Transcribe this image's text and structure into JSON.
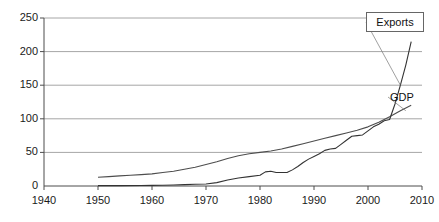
{
  "chart_data": {
    "type": "line",
    "title": "",
    "subtitle": "",
    "xlabel": "",
    "ylabel": "",
    "xlim": [
      1940,
      2010
    ],
    "ylim": [
      0,
      250
    ],
    "grid": true,
    "grid_axis": "y",
    "legend_position": "inline-right",
    "xticks": [
      1940,
      1950,
      1960,
      1970,
      1980,
      1990,
      2000,
      2010
    ],
    "yticks": [
      0,
      50,
      100,
      150,
      200,
      250
    ],
    "xtick_labels": [
      "1940",
      "1950",
      "1960",
      "1970",
      "1980",
      "1990",
      "2000",
      "2010"
    ],
    "ytick_labels": [
      "0",
      "50",
      "100",
      "150",
      "200",
      "250"
    ],
    "series": [
      {
        "name": "GDP",
        "color": "#4d4d4d",
        "label_text": "GDP",
        "x": [
          1950,
          1952,
          1954,
          1956,
          1958,
          1960,
          1962,
          1964,
          1966,
          1968,
          1970,
          1972,
          1974,
          1976,
          1978,
          1980,
          1982,
          1984,
          1986,
          1988,
          1990,
          1992,
          1994,
          1996,
          1998,
          2000,
          2002,
          2004,
          2006,
          2008
        ],
        "values": [
          13,
          14,
          15,
          16,
          17,
          18,
          20,
          22,
          25,
          28,
          32,
          36,
          41,
          45,
          48,
          50,
          52,
          55,
          59,
          63,
          67,
          71,
          75,
          79,
          83,
          88,
          95,
          103,
          112,
          120
        ]
      },
      {
        "name": "Exports",
        "color": "#333333",
        "label_text": "Exports",
        "boxed_label": true,
        "x": [
          1950,
          1954,
          1958,
          1960,
          1962,
          1964,
          1966,
          1968,
          1970,
          1972,
          1974,
          1976,
          1978,
          1980,
          1981,
          1982,
          1983,
          1984,
          1985,
          1986,
          1987,
          1988,
          1989,
          1990,
          1991,
          1992,
          1993,
          1994,
          1995,
          1996,
          1997,
          1998,
          1999,
          2000,
          2001,
          2002,
          2003,
          2004,
          2005,
          2006,
          2007,
          2008
        ],
        "values": [
          0.5,
          0.6,
          0.8,
          1,
          1.2,
          1.5,
          2,
          2.5,
          3,
          5,
          9,
          12,
          14,
          16,
          21,
          22,
          20,
          20,
          20,
          24,
          29,
          35,
          40,
          44,
          48,
          53,
          55,
          56,
          62,
          68,
          74,
          75,
          76,
          82,
          88,
          92,
          97,
          99,
          122,
          150,
          180,
          215
        ]
      }
    ],
    "annotations": [
      {
        "name": "exports-callout",
        "text": "Exports",
        "boxed": true
      },
      {
        "name": "gdp-callout",
        "text": "GDP",
        "boxed": false
      }
    ],
    "colors": {
      "gridline": "#a6a6a6",
      "axis": "#4d4d4d",
      "text": "#111111",
      "background": "#ffffff",
      "label_box_border": "#666666"
    }
  }
}
